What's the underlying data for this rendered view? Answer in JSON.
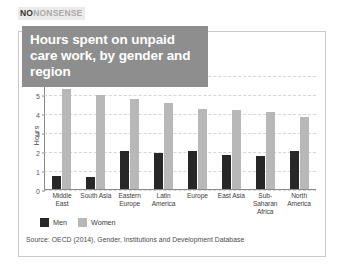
{
  "brand": {
    "part1": "NO",
    "part2": "NONSENSE"
  },
  "title": "Hours spent on unpaid care work, by gender and region",
  "source": "Source: OECD (2014), Gender, Institutions and Development Database",
  "legend": [
    {
      "label": "Men",
      "color": "#272727"
    },
    {
      "label": "Women",
      "color": "#b8b8b8"
    }
  ],
  "chart_data": {
    "type": "bar",
    "title": "Hours spent on unpaid care work, by gender and region",
    "xlabel": "",
    "ylabel": "Hours",
    "ylim": [
      0,
      6
    ],
    "yticks": [
      0,
      1,
      2,
      3,
      4,
      5,
      6
    ],
    "grid": true,
    "legend_position": "bottom-left",
    "categories": [
      "Middle East",
      "South Asia",
      "Eastern Europe",
      "Latin America",
      "Europe",
      "East Asia",
      "Sub-Saharan Africa",
      "North America"
    ],
    "series": [
      {
        "name": "Men",
        "color": "#272727",
        "values": [
          0.7,
          0.65,
          2.0,
          1.9,
          2.0,
          1.8,
          1.75,
          2.0
        ]
      },
      {
        "name": "Women",
        "color": "#b8b8b8",
        "values": [
          5.3,
          5.0,
          4.8,
          4.55,
          4.25,
          4.2,
          4.1,
          3.8
        ]
      }
    ]
  }
}
